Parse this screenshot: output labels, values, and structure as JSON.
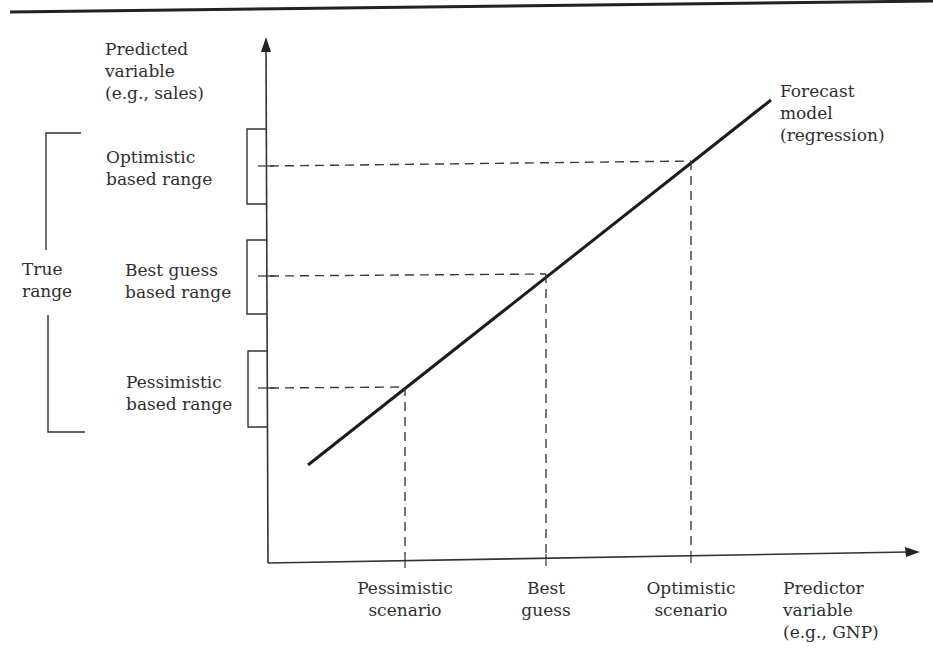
{
  "header_rule": {
    "color": "#222222"
  },
  "y_axis": {
    "label_lines": [
      "Predicted",
      "variable",
      "(e.g., sales)"
    ]
  },
  "x_axis": {
    "label_lines": [
      "Predictor",
      "variable",
      "(e.g., GNP)"
    ]
  },
  "forecast_line": {
    "label_lines": [
      "Forecast",
      "model",
      "(regression)"
    ]
  },
  "ranges": [
    {
      "id": "optimistic",
      "lines": [
        "Optimistic",
        "based range"
      ]
    },
    {
      "id": "best_guess",
      "lines": [
        "Best guess",
        "based range"
      ]
    },
    {
      "id": "pessimistic",
      "lines": [
        "Pessimistic",
        "based range"
      ]
    }
  ],
  "true_range": {
    "lines": [
      "True",
      "range"
    ]
  },
  "scenarios": [
    {
      "id": "pessimistic",
      "lines": [
        "Pessimistic",
        "scenario"
      ]
    },
    {
      "id": "best_guess",
      "lines": [
        "Best",
        "guess"
      ]
    },
    {
      "id": "optimistic",
      "lines": [
        "Optimistic",
        "scenario"
      ]
    }
  ],
  "colors": {
    "ink": "#2a2a2a",
    "line": "#1c1c1c",
    "dash": "#3a3a3a"
  }
}
